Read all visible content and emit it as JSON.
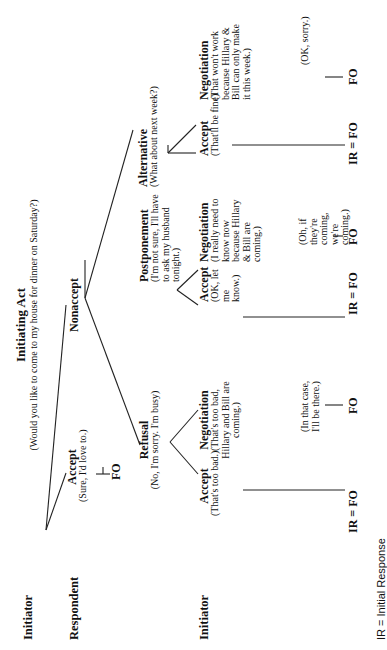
{
  "row_labels": {
    "initiator_1": "Initiator",
    "respondent": "Respondent",
    "initiator_2": "Initiator"
  },
  "initiating_act": {
    "title": "Initiating Act",
    "utterance": "(Would you like to come to my house for dinner on Saturday?)"
  },
  "respondent": {
    "accept": {
      "title": "Accept",
      "utterance": "(Sure, I'd love to.)",
      "outcome": "FO"
    },
    "nonaccept": {
      "title": "Nonaccept"
    }
  },
  "nonaccept_branches": {
    "refusal": {
      "title": "Refusal",
      "utterance": "(No, I'm sorry. I'm busy)"
    },
    "postponement": {
      "title": "Postponement",
      "utterance": "(I'm not sure, I'll have to ask my husband tonight.)"
    },
    "alternative": {
      "title": "Alternative",
      "utterance": "(What about next week?)"
    }
  },
  "initiator_responses": {
    "refusal": {
      "accept": {
        "title": "Accept",
        "utterance": "(That's too bad.)",
        "outcome": "IR = FO"
      },
      "negotiation": {
        "title": "Negotiation",
        "utterance": "(That's too bad, Hillary and Bill are coming.)",
        "reply": "(In that case, I'll be there.)",
        "outcome": "FO"
      }
    },
    "postponement": {
      "accept": {
        "title": "Accept",
        "utterance": "(OK, let me know.)",
        "outcome": "IR = FO"
      },
      "negotiation": {
        "title": "Negotiation",
        "utterance": "(I really need to know now because Hillary & Bill are coming.)",
        "reply": "(Oh, if they're coming, we're coming.)",
        "outcome": "FO"
      }
    },
    "alternative": {
      "accept": {
        "title": "Accept",
        "utterance": "(That'll be fine)",
        "outcome": "IR = FO"
      },
      "negotiation": {
        "title": "Negotiation",
        "utterance": "(That won't work because Hillary & Bill can only make it this week.)",
        "reply": "(OK, sorry.)",
        "outcome": "FO"
      }
    }
  },
  "legend": "IR = Initial Response"
}
